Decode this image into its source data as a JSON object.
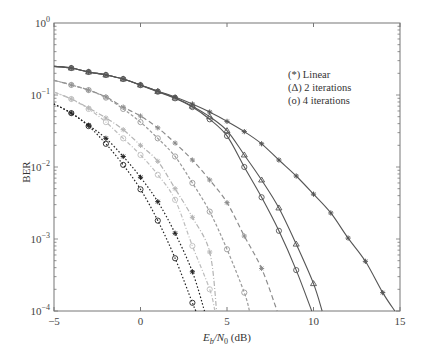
{
  "chart_data": {
    "type": "line",
    "title": "",
    "xlabel": "E_b/N_0 (dB)",
    "xlabel_parts": {
      "E": "E",
      "b": "b",
      "slash": "/N",
      "zero": "0",
      "unit": " (dB)"
    },
    "ylabel": "BER",
    "xlim": [
      -5,
      15
    ],
    "ylim": [
      0.0001,
      1
    ],
    "yscale": "log",
    "grid": false,
    "x_ticks": [
      "-5",
      "0",
      "5",
      "10",
      "15"
    ],
    "x_tick_values": [
      -5,
      0,
      5,
      10,
      15
    ],
    "y_ticks": [
      {
        "base": "10",
        "exp": "0",
        "value": 1
      },
      {
        "base": "10",
        "exp": "-1",
        "value": 0.1
      },
      {
        "base": "10",
        "exp": "-2",
        "value": 0.01
      },
      {
        "base": "10",
        "exp": "-3",
        "value": 0.001
      },
      {
        "base": "10",
        "exp": "-4",
        "value": 0.0001
      }
    ],
    "legend": {
      "position": "upper right (inside)",
      "entries": [
        "(*) Linear",
        "(Δ) 2 iterations",
        "(o) 4 iterations"
      ]
    },
    "series": [
      {
        "name": "Linear (solid)",
        "group": "solid",
        "marker": "asterisk",
        "color": "#555555",
        "dash": "",
        "x": [
          -5,
          -4,
          -3,
          -2,
          -1,
          0,
          1,
          2,
          3,
          4,
          5,
          6,
          7,
          8,
          9,
          10,
          11,
          12,
          13,
          14,
          14.7
        ],
        "values": [
          0.25,
          0.237,
          0.209,
          0.19,
          0.167,
          0.138,
          0.113,
          0.094,
          0.075,
          0.058,
          0.043,
          0.031,
          0.021,
          0.0125,
          0.0075,
          0.0042,
          0.0023,
          0.00103,
          0.00049,
          0.00018,
          0.0001
        ],
        "marker_x": [
          -4,
          -3,
          -2,
          -1,
          0,
          1,
          2,
          3,
          4,
          5,
          6,
          7,
          8,
          9,
          10,
          11,
          12,
          13,
          14
        ]
      },
      {
        "name": "2 iterations (solid)",
        "group": "solid",
        "marker": "triangle",
        "color": "#555555",
        "dash": "",
        "x": [
          -5,
          -4,
          -3,
          -2,
          -1,
          0,
          1,
          2,
          3,
          4,
          5,
          6,
          7,
          8,
          9,
          10,
          10.5
        ],
        "values": [
          0.25,
          0.237,
          0.209,
          0.19,
          0.167,
          0.138,
          0.112,
          0.091,
          0.07,
          0.05,
          0.032,
          0.0147,
          0.0066,
          0.0027,
          0.00085,
          0.00024,
          0.0001
        ],
        "marker_x": [
          -4,
          -3,
          -2,
          -1,
          0,
          1,
          2,
          3,
          4,
          5,
          6,
          7,
          8,
          9,
          10
        ]
      },
      {
        "name": "4 iterations (solid)",
        "group": "solid",
        "marker": "circle",
        "color": "#555555",
        "dash": "",
        "x": [
          -5,
          -4,
          -3,
          -2,
          -1,
          0,
          1,
          2,
          3,
          4,
          5,
          6,
          7,
          8,
          9,
          9.9
        ],
        "values": [
          0.25,
          0.237,
          0.209,
          0.19,
          0.167,
          0.137,
          0.111,
          0.09,
          0.068,
          0.046,
          0.027,
          0.01,
          0.0038,
          0.0013,
          0.00037,
          0.0001
        ],
        "marker_x": [
          -4,
          -3,
          -2,
          -1,
          0,
          1,
          2,
          3,
          4,
          5,
          6,
          7,
          8,
          9
        ]
      },
      {
        "name": "Linear (medium gray dashed)",
        "group": "dashed",
        "marker": "asterisk",
        "color": "#8c8c8c",
        "dash": "5,3",
        "x": [
          -5,
          -4,
          -3,
          -2,
          -1,
          0,
          1,
          2,
          3,
          4,
          5,
          6,
          7,
          7.9
        ],
        "values": [
          0.16,
          0.138,
          0.117,
          0.094,
          0.068,
          0.051,
          0.035,
          0.0215,
          0.0125,
          0.0066,
          0.0032,
          0.0011,
          0.00039,
          0.0001
        ],
        "marker_x": [
          -4,
          -3,
          -2,
          -1,
          0,
          1,
          2,
          3,
          4,
          5,
          6,
          7
        ]
      },
      {
        "name": "Iterative (medium gray dashed)",
        "group": "dashed",
        "marker": "circle",
        "color": "#9a9a9a",
        "dash": "3,2",
        "x": [
          -5,
          -4,
          -3,
          -2,
          -1,
          0,
          1,
          2,
          3,
          4,
          5,
          6,
          6.3
        ],
        "values": [
          0.16,
          0.138,
          0.117,
          0.092,
          0.064,
          0.042,
          0.025,
          0.014,
          0.006,
          0.0024,
          0.00072,
          0.00018,
          0.0001
        ],
        "marker_x": [
          -4,
          -3,
          -2,
          -1,
          0,
          1,
          2,
          3,
          4,
          5,
          6
        ]
      },
      {
        "name": "Linear (light gray dash-dot)",
        "group": "dashdot",
        "marker": "asterisk",
        "color": "#b4b4b4",
        "dash": "5,2,1,2",
        "x": [
          -5,
          -4,
          -3,
          -2,
          -1,
          0,
          1,
          2,
          3,
          4,
          4.4
        ],
        "values": [
          0.11,
          0.088,
          0.066,
          0.048,
          0.033,
          0.02,
          0.012,
          0.005,
          0.002,
          0.00066,
          0.0001
        ],
        "marker_x": [
          -4,
          -3,
          -2,
          -1,
          0,
          1,
          2,
          3,
          4
        ]
      },
      {
        "name": "Iterative (light gray dash-dot)",
        "group": "dashdot",
        "marker": "circle",
        "color": "#bdbdbd",
        "dash": "4,2,1,2",
        "x": [
          -5,
          -4,
          -3,
          -2,
          -1,
          0,
          1,
          2,
          3,
          4,
          4.3
        ],
        "values": [
          0.11,
          0.088,
          0.064,
          0.042,
          0.025,
          0.0147,
          0.0078,
          0.0035,
          0.0008,
          0.0002,
          0.0001
        ],
        "marker_x": [
          -4,
          -3,
          -2,
          -1,
          0,
          1,
          2,
          3,
          4
        ]
      },
      {
        "name": "Linear (black dotted)",
        "group": "dotted",
        "marker": "asterisk",
        "color": "#222222",
        "dash": "1.5,2",
        "x": [
          -5,
          -4,
          -3,
          -2,
          -1,
          0,
          1,
          2,
          3,
          3.7
        ],
        "values": [
          0.075,
          0.056,
          0.038,
          0.025,
          0.014,
          0.0072,
          0.0033,
          0.0012,
          0.00035,
          0.0001
        ],
        "marker_x": [
          -4,
          -3,
          -2,
          -1,
          0,
          1,
          2,
          3
        ]
      },
      {
        "name": "Iterative (black dotted)",
        "group": "dotted",
        "marker": "circle",
        "color": "#222222",
        "dash": "1.5,2",
        "x": [
          -5,
          -4,
          -3,
          -2,
          -1,
          0,
          1,
          2,
          3,
          3.2
        ],
        "values": [
          0.075,
          0.056,
          0.037,
          0.021,
          0.0107,
          0.0049,
          0.0018,
          0.00054,
          0.00013,
          0.0001
        ],
        "marker_x": [
          -4,
          -3,
          -2,
          -1,
          0,
          1,
          2,
          3
        ]
      }
    ]
  }
}
